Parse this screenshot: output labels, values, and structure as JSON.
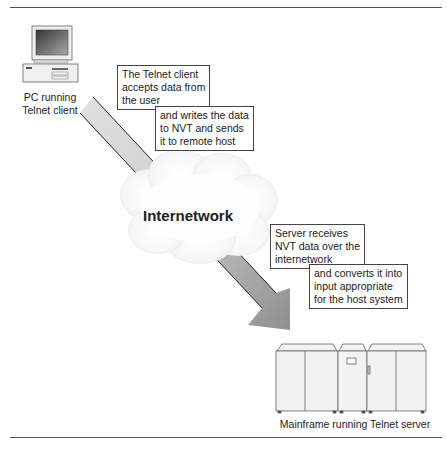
{
  "diagram": {
    "client": {
      "label_line1": "PC running",
      "label_line2": "Telnet client"
    },
    "server": {
      "label": "Mainframe running Telnet server"
    },
    "network": {
      "label": "Internetwork"
    },
    "client_notes": {
      "box1": [
        "The Telnet client",
        "accepts data from",
        "the user"
      ],
      "box2": [
        "and writes the data",
        "to NVT and sends",
        "it to remote host"
      ]
    },
    "server_notes": {
      "box1": [
        "Server receives",
        "NVT data over the",
        "internetwork"
      ],
      "box2": [
        "and converts it into",
        "input appropriate",
        "for the host system"
      ]
    },
    "colors": {
      "arrow_light": "#d8d8d8",
      "arrow_dark": "#9a9a9a",
      "cloud": "#f4f4f4",
      "rule": "#555555"
    }
  }
}
